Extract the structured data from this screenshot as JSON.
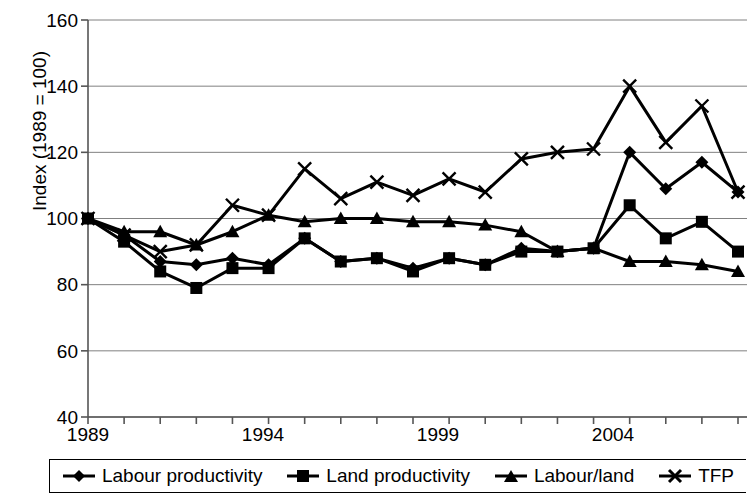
{
  "chart_data": {
    "type": "line",
    "title": "",
    "subtitle": "",
    "xlabel": "",
    "ylabel": "Index (1989 = 100)",
    "ylim": [
      40,
      160
    ],
    "xlim": [
      1989,
      2007
    ],
    "grid": true,
    "legend_position": "bottom",
    "y_ticks": [
      40,
      60,
      80,
      100,
      120,
      140,
      160
    ],
    "x_ticks": [
      1989,
      1990,
      1991,
      1992,
      1993,
      1994,
      1995,
      1996,
      1997,
      1998,
      1999,
      2000,
      2001,
      2002,
      2003,
      2004,
      2005,
      2006,
      2007
    ],
    "x_tick_labels": [
      "1989",
      "",
      "",
      "",
      "",
      "1994",
      "",
      "",
      "",
      "",
      "1999",
      "",
      "",
      "",
      "",
      "2004",
      "",
      "",
      ""
    ],
    "x": [
      1989,
      1990,
      1991,
      1992,
      1993,
      1994,
      1995,
      1996,
      1997,
      1998,
      1999,
      2000,
      2001,
      2002,
      2003,
      2004,
      2005,
      2006,
      2007
    ],
    "series": [
      {
        "name": "Labour productivity",
        "marker": "diamond",
        "color": "#000000",
        "values": [
          100,
          95,
          87,
          86,
          88,
          86,
          94,
          87,
          88,
          85,
          88,
          86,
          91,
          90,
          91,
          120,
          109,
          117,
          108
        ]
      },
      {
        "name": "Land productivity",
        "marker": "square",
        "color": "#000000",
        "values": [
          100,
          93,
          84,
          79,
          85,
          85,
          94,
          87,
          88,
          84,
          88,
          86,
          90,
          90,
          91,
          104,
          94,
          99,
          90
        ]
      },
      {
        "name": "Labour/land",
        "marker": "triangle",
        "color": "#000000",
        "values": [
          100,
          96,
          96,
          92,
          96,
          101,
          99,
          100,
          100,
          99,
          99,
          98,
          96,
          90,
          91,
          87,
          87,
          86,
          84
        ]
      },
      {
        "name": "TFP",
        "marker": "cross",
        "color": "#000000",
        "values": [
          100,
          95,
          90,
          92,
          104,
          101,
          115,
          106,
          111,
          107,
          112,
          108,
          118,
          120,
          121,
          140,
          123,
          134,
          108
        ]
      }
    ]
  },
  "axis": {
    "y_title": "Index (1989 = 100)",
    "y_tick_labels": [
      "160",
      "140",
      "120",
      "100",
      "80",
      "60",
      "40"
    ],
    "x_visible_labels": [
      "1989",
      "1994",
      "1999",
      "2004"
    ]
  },
  "legend": {
    "items": [
      {
        "label": "Labour productivity",
        "marker": "diamond-marker"
      },
      {
        "label": "Land productivity",
        "marker": "square-marker"
      },
      {
        "label": "Labour/land",
        "marker": "triangle-marker"
      },
      {
        "label": "TFP",
        "marker": "cross-marker"
      }
    ]
  },
  "colors": {
    "line": "#000000",
    "grid": "#808080",
    "axis": "#000000",
    "background": "#ffffff"
  }
}
